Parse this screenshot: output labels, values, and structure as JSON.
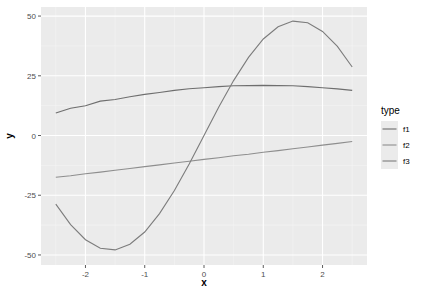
{
  "chart_data": {
    "type": "line",
    "title": "",
    "xlabel": "x",
    "ylabel": "y",
    "xlim": [
      -2.5,
      2.5
    ],
    "ylim": [
      -50,
      50
    ],
    "x_ticks": [
      -2,
      -1,
      0,
      1,
      2
    ],
    "y_ticks": [
      -50,
      -25,
      0,
      25,
      50
    ],
    "grid": true,
    "legend_position": "right",
    "legend_title": "type",
    "x": [
      -2.5,
      -2.25,
      -2.0,
      -1.75,
      -1.5,
      -1.25,
      -1.0,
      -0.75,
      -0.5,
      -0.25,
      0.0,
      0.25,
      0.5,
      0.75,
      1.0,
      1.25,
      1.5,
      1.75,
      2.0,
      2.25,
      2.5
    ],
    "series": [
      {
        "name": "f1",
        "color": "#6e6e6e",
        "values": [
          9.4,
          11.4,
          12.5,
          14.4,
          15.1,
          16.2,
          17.2,
          18.0,
          18.9,
          19.6,
          20.0,
          20.5,
          20.8,
          20.9,
          21.0,
          20.9,
          20.8,
          20.5,
          20.0,
          19.5,
          18.9
        ]
      },
      {
        "name": "f2",
        "color": "#8e8e8e",
        "values": [
          -17.5,
          -16.8,
          -16.0,
          -15.3,
          -14.5,
          -13.8,
          -13.0,
          -12.3,
          -11.5,
          -10.8,
          -10.0,
          -9.3,
          -8.5,
          -7.8,
          -7.0,
          -6.3,
          -5.5,
          -4.8,
          -4.0,
          -3.3,
          -2.5
        ]
      },
      {
        "name": "f3",
        "color": "#7c7c7c",
        "values": [
          -28.7,
          -37.3,
          -43.6,
          -47.2,
          -47.9,
          -45.5,
          -40.4,
          -32.7,
          -23.0,
          -11.9,
          0.0,
          11.9,
          23.0,
          32.7,
          40.4,
          45.5,
          47.9,
          47.2,
          43.6,
          37.3,
          28.7
        ]
      }
    ]
  },
  "axes": {
    "x_title": "x",
    "y_title": "y",
    "x_tick_labels": [
      "-2",
      "-1",
      "0",
      "1",
      "2"
    ],
    "y_tick_labels": [
      "-50",
      "-25",
      "0",
      "25",
      "50"
    ]
  },
  "legend": {
    "title": "type",
    "items": [
      "f1",
      "f2",
      "f3"
    ]
  }
}
